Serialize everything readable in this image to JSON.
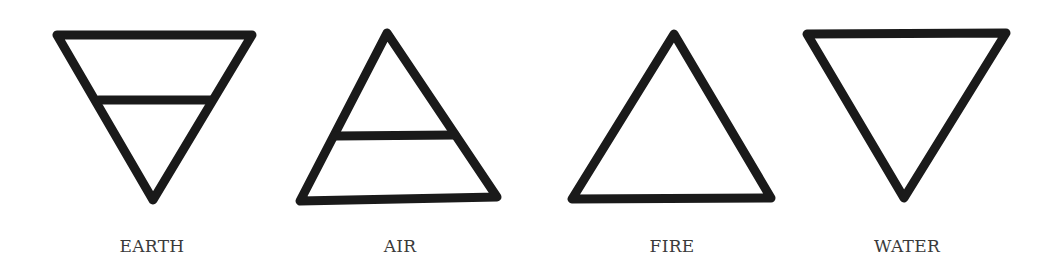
{
  "symbols": [
    {
      "id": "earth",
      "label": "EARTH",
      "shape": "downward triangle with horizontal bar"
    },
    {
      "id": "air",
      "label": "AIR",
      "shape": "upward triangle with horizontal bar"
    },
    {
      "id": "fire",
      "label": "FIRE",
      "shape": "upward triangle"
    },
    {
      "id": "water",
      "label": "WATER",
      "shape": "downward triangle"
    }
  ],
  "colors": {
    "stroke": "#1a1a1a",
    "label": "#3a3a3a",
    "background": "#ffffff"
  }
}
